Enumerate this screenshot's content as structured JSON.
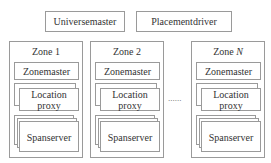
{
  "top": {
    "universemaster": "Universemaster",
    "placementdriver": "Placementdriver"
  },
  "zones": [
    {
      "title": "Zone 1",
      "zonemaster": "Zonemaster",
      "location_proxy": "Location proxy",
      "spanserver": "Spanserver"
    },
    {
      "title": "Zone 2",
      "zonemaster": "Zonemaster",
      "location_proxy": "Location proxy",
      "spanserver": "Spanserver"
    },
    {
      "title_prefix": "Zone ",
      "title_var": "N",
      "zonemaster": "Zonemaster",
      "location_proxy": "Location proxy",
      "spanserver": "Spanserver"
    }
  ],
  "ellipsis": "......",
  "colors": {
    "border": "#9a9a9a",
    "text": "#333333"
  }
}
